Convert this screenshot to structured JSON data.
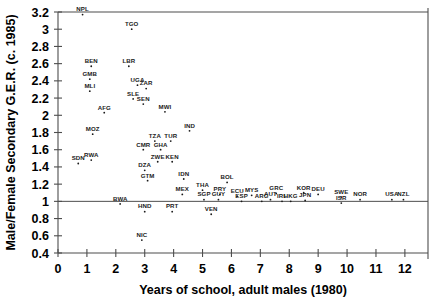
{
  "chart_data": {
    "type": "scatter",
    "title": "",
    "xlabel": "Years of school, adult males (1980)",
    "ylabel": "Male/Female Secondary G.E.R. (c. 1985)",
    "xlim": [
      0,
      12.8
    ],
    "ylim": [
      0.4,
      3.2
    ],
    "xticks": [
      "0",
      "1",
      "2",
      "3",
      "4",
      "5",
      "6",
      "7",
      "8",
      "9",
      "10",
      "11",
      "12"
    ],
    "yticks": [
      "0.4",
      "0.6",
      "0.8",
      "1",
      "1.2",
      "1.4",
      "1.6",
      "1.8",
      "2",
      "2.2",
      "2.4",
      "2.6",
      "2.8",
      "3",
      "3.2"
    ],
    "grid": false,
    "legend": "none",
    "reference_line": {
      "y": 1.0,
      "label": ""
    },
    "point_color": "#1a1a1a",
    "axis_color": "#4d4d4d",
    "points": [
      {
        "label": "NPL",
        "x": 0.85,
        "y": 3.17
      },
      {
        "label": "TGO",
        "x": 2.55,
        "y": 3.0
      },
      {
        "label": "BEN",
        "x": 1.15,
        "y": 2.57
      },
      {
        "label": "LBR",
        "x": 2.45,
        "y": 2.57
      },
      {
        "label": "GMB",
        "x": 1.1,
        "y": 2.42
      },
      {
        "label": "UGA",
        "x": 2.75,
        "y": 2.35
      },
      {
        "label": "ZAR",
        "x": 3.05,
        "y": 2.31
      },
      {
        "label": "MLI",
        "x": 1.1,
        "y": 2.28
      },
      {
        "label": "SLE",
        "x": 2.6,
        "y": 2.19
      },
      {
        "label": "SEN",
        "x": 2.95,
        "y": 2.13
      },
      {
        "label": "AFG",
        "x": 1.6,
        "y": 2.03
      },
      {
        "label": "MWI",
        "x": 3.7,
        "y": 2.04
      },
      {
        "label": "IND",
        "x": 4.55,
        "y": 1.82
      },
      {
        "label": "MOZ",
        "x": 1.2,
        "y": 1.78
      },
      {
        "label": "TZA",
        "x": 3.35,
        "y": 1.7
      },
      {
        "label": "TUR",
        "x": 3.9,
        "y": 1.7
      },
      {
        "label": "CMR",
        "x": 2.95,
        "y": 1.6
      },
      {
        "label": "GHA",
        "x": 3.55,
        "y": 1.6
      },
      {
        "label": "SDN",
        "x": 0.7,
        "y": 1.44
      },
      {
        "label": "RWA",
        "x": 1.15,
        "y": 1.48
      },
      {
        "label": "ZWE",
        "x": 3.45,
        "y": 1.46
      },
      {
        "label": "KEN",
        "x": 3.95,
        "y": 1.46
      },
      {
        "label": "DZA",
        "x": 3.0,
        "y": 1.36
      },
      {
        "label": "GTM",
        "x": 3.1,
        "y": 1.24
      },
      {
        "label": "IDN",
        "x": 4.35,
        "y": 1.26
      },
      {
        "label": "BOL",
        "x": 5.85,
        "y": 1.22
      },
      {
        "label": "THA",
        "x": 5.0,
        "y": 1.13
      },
      {
        "label": "MEX",
        "x": 4.3,
        "y": 1.08
      },
      {
        "label": "PRY",
        "x": 5.6,
        "y": 1.08
      },
      {
        "label": "SGP",
        "x": 5.05,
        "y": 1.02
      },
      {
        "label": "GUY",
        "x": 5.55,
        "y": 1.02
      },
      {
        "label": "ECU",
        "x": 6.2,
        "y": 1.06
      },
      {
        "label": "MYS",
        "x": 6.7,
        "y": 1.07
      },
      {
        "label": "ESP",
        "x": 6.35,
        "y": 1.0
      },
      {
        "label": "ARG",
        "x": 7.05,
        "y": 1.0
      },
      {
        "label": "GRC",
        "x": 7.55,
        "y": 1.09
      },
      {
        "label": "AUT",
        "x": 7.35,
        "y": 1.02
      },
      {
        "label": "IRL",
        "x": 7.75,
        "y": 1.0
      },
      {
        "label": "HKG",
        "x": 8.05,
        "y": 1.0
      },
      {
        "label": "KOR",
        "x": 8.5,
        "y": 1.1
      },
      {
        "label": "JPN",
        "x": 8.55,
        "y": 1.01
      },
      {
        "label": "DEU",
        "x": 9.0,
        "y": 1.08
      },
      {
        "label": "SWE",
        "x": 9.8,
        "y": 1.05
      },
      {
        "label": "ISR",
        "x": 9.8,
        "y": 0.98
      },
      {
        "label": "NOR",
        "x": 10.45,
        "y": 1.02
      },
      {
        "label": "USA",
        "x": 11.55,
        "y": 1.02
      },
      {
        "label": "NZL",
        "x": 11.95,
        "y": 1.02
      },
      {
        "label": "BWA",
        "x": 2.15,
        "y": 0.97
      },
      {
        "label": "HND",
        "x": 3.0,
        "y": 0.88
      },
      {
        "label": "PRT",
        "x": 3.95,
        "y": 0.88
      },
      {
        "label": "VEN",
        "x": 5.3,
        "y": 0.85
      },
      {
        "label": "NIC",
        "x": 2.9,
        "y": 0.55
      }
    ]
  }
}
